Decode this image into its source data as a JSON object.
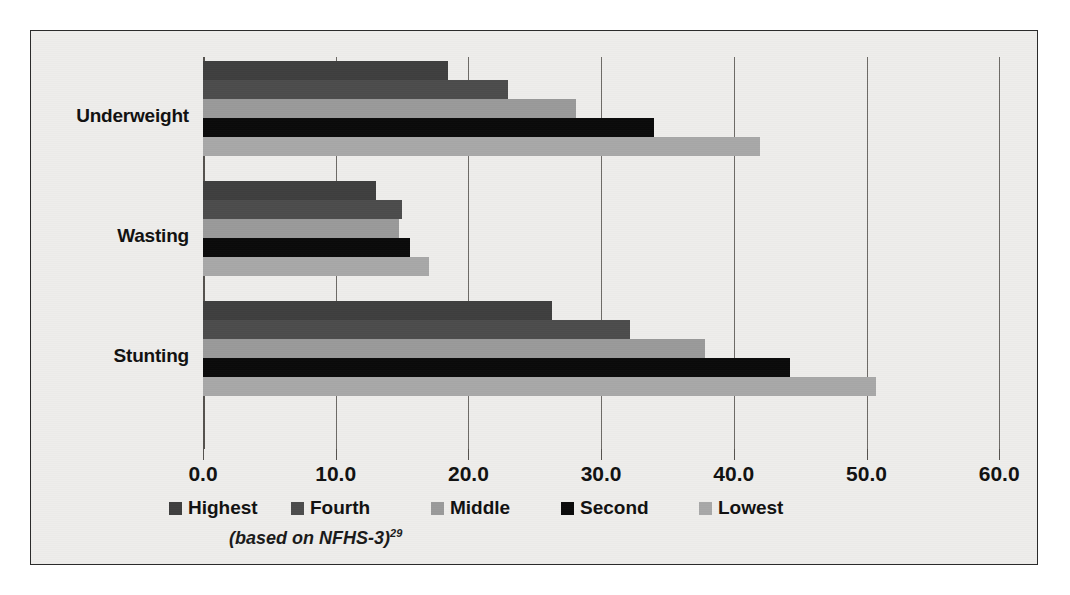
{
  "figure": {
    "background_color": "#eeedeb",
    "border_color": "#2b2b2b",
    "source_note": "(based on NFHS-3)",
    "source_superscript": "29"
  },
  "chart_data": {
    "type": "bar",
    "orientation": "horizontal",
    "title": "",
    "subtitle": "",
    "xlabel": "",
    "ylabel": "",
    "xlim": [
      0,
      60
    ],
    "ylim": null,
    "grid": true,
    "grid_axis": "x",
    "legend_position": "bottom",
    "categories": [
      "Underweight",
      "Wasting",
      "Stunting"
    ],
    "tick_labels": [
      "0.0",
      "10.0",
      "20.0",
      "30.0",
      "40.0",
      "50.0",
      "60.0"
    ],
    "tick_values": [
      0,
      10,
      20,
      30,
      40,
      50,
      60
    ],
    "series": [
      {
        "name": "Highest",
        "color": "#3f3f3f",
        "values": [
          18.5,
          13.0,
          26.3
        ]
      },
      {
        "name": "Fourth",
        "color": "#4c4c4c",
        "values": [
          23.0,
          15.0,
          32.2
        ]
      },
      {
        "name": "Middle",
        "color": "#9a9a9a",
        "values": [
          28.1,
          14.8,
          37.8
        ]
      },
      {
        "name": "Second",
        "color": "#0a0a0a",
        "values": [
          34.0,
          15.6,
          44.2
        ]
      },
      {
        "name": "Lowest",
        "color": "#a8a8a8",
        "values": [
          42.0,
          17.0,
          50.7
        ]
      }
    ]
  }
}
